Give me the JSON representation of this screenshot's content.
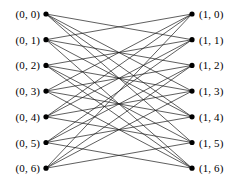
{
  "figure": {
    "width": 241,
    "height": 190,
    "background": "#ffffff",
    "edge_color": "#1a1a1a",
    "node_color": "#000000"
  },
  "layout": {
    "left_node_x": 46,
    "right_node_x": 192,
    "first_node_y": 14,
    "node_spacing": 25.7,
    "node_radius": 2.6,
    "left_label_offset": 6,
    "right_label_offset": 7
  },
  "left_nodes": [
    {
      "id": "L0",
      "label": "(0, 0)",
      "index": 0
    },
    {
      "id": "L1",
      "label": "(0, 1)",
      "index": 1
    },
    {
      "id": "L2",
      "label": "(0, 2)",
      "index": 2
    },
    {
      "id": "L3",
      "label": "(0, 3)",
      "index": 3
    },
    {
      "id": "L4",
      "label": "(0, 4)",
      "index": 4
    },
    {
      "id": "L5",
      "label": "(0, 5)",
      "index": 5
    },
    {
      "id": "L6",
      "label": "(0, 6)",
      "index": 6
    }
  ],
  "right_nodes": [
    {
      "id": "R0",
      "label": "(1, 0)",
      "index": 0
    },
    {
      "id": "R1",
      "label": "(1, 1)",
      "index": 1
    },
    {
      "id": "R2",
      "label": "(1, 2)",
      "index": 2
    },
    {
      "id": "R3",
      "label": "(1, 3)",
      "index": 3
    },
    {
      "id": "R4",
      "label": "(1, 4)",
      "index": 4
    },
    {
      "id": "R5",
      "label": "(1, 5)",
      "index": 5
    },
    {
      "id": "R6",
      "label": "(1, 6)",
      "index": 6
    }
  ],
  "edges": [
    {
      "from": 0,
      "to": 1
    },
    {
      "from": 0,
      "to": 3
    },
    {
      "from": 0,
      "to": 4
    },
    {
      "from": 0,
      "to": 5
    },
    {
      "from": 1,
      "to": 0
    },
    {
      "from": 1,
      "to": 2
    },
    {
      "from": 1,
      "to": 4
    },
    {
      "from": 1,
      "to": 6
    },
    {
      "from": 2,
      "to": 1
    },
    {
      "from": 2,
      "to": 3
    },
    {
      "from": 2,
      "to": 5
    },
    {
      "from": 2,
      "to": 6
    },
    {
      "from": 3,
      "to": 0
    },
    {
      "from": 3,
      "to": 2
    },
    {
      "from": 3,
      "to": 4
    },
    {
      "from": 3,
      "to": 6
    },
    {
      "from": 4,
      "to": 0
    },
    {
      "from": 4,
      "to": 1
    },
    {
      "from": 4,
      "to": 3
    },
    {
      "from": 4,
      "to": 5
    },
    {
      "from": 5,
      "to": 1
    },
    {
      "from": 5,
      "to": 2
    },
    {
      "from": 5,
      "to": 4
    },
    {
      "from": 5,
      "to": 6
    },
    {
      "from": 6,
      "to": 0
    },
    {
      "from": 6,
      "to": 2
    },
    {
      "from": 6,
      "to": 3
    },
    {
      "from": 6,
      "to": 5
    }
  ],
  "summary": {
    "left_count": 7,
    "right_count": 7,
    "edge_count": 28,
    "degree": 4
  }
}
